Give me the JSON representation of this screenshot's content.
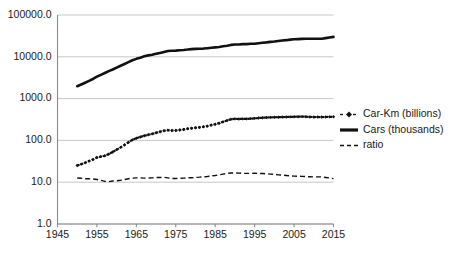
{
  "chart_data": {
    "type": "line",
    "title": "",
    "subtitle": "",
    "xlabel": "",
    "ylabel": "",
    "yscale": "log",
    "ylim": [
      1.0,
      100000.0
    ],
    "xlim": [
      1945,
      2015
    ],
    "grid": true,
    "legend_position": "right",
    "y_ticks": [
      "100000.0",
      "10000.0",
      "1000.0",
      "100.0",
      "10.0",
      "1.0"
    ],
    "y_tick_values": [
      100000.0,
      10000.0,
      1000.0,
      100.0,
      10.0,
      1.0
    ],
    "x_ticks": [
      "1945",
      "1955",
      "1965",
      "1975",
      "1985",
      "1995",
      "2005",
      "2015"
    ],
    "x_tick_values": [
      1945,
      1955,
      1965,
      1975,
      1985,
      1995,
      2005,
      2015
    ],
    "x": [
      1950,
      1951,
      1952,
      1953,
      1954,
      1955,
      1956,
      1957,
      1958,
      1959,
      1960,
      1961,
      1962,
      1963,
      1964,
      1965,
      1966,
      1967,
      1968,
      1969,
      1970,
      1971,
      1972,
      1973,
      1974,
      1975,
      1976,
      1977,
      1978,
      1979,
      1980,
      1981,
      1982,
      1983,
      1984,
      1985,
      1986,
      1987,
      1988,
      1989,
      1990,
      1991,
      1992,
      1993,
      1994,
      1995,
      1996,
      1997,
      1998,
      1999,
      2000,
      2001,
      2002,
      2003,
      2004,
      2005,
      2006,
      2007,
      2008,
      2009,
      2010,
      2011,
      2012,
      2013,
      2014,
      2015
    ],
    "series": [
      {
        "name": "Car-Km (billions)",
        "style": "dashed-with-diamond-markers",
        "marker": "diamond",
        "color": "#111111",
        "values": [
          25,
          27,
          29,
          32,
          35,
          39,
          41,
          43,
          47,
          53,
          60,
          68,
          78,
          90,
          103,
          113,
          121,
          129,
          136,
          143,
          152,
          161,
          170,
          176,
          172,
          173,
          178,
          183,
          190,
          196,
          200,
          205,
          212,
          220,
          232,
          244,
          258,
          278,
          300,
          320,
          328,
          325,
          327,
          328,
          332,
          337,
          343,
          348,
          352,
          356,
          358,
          359,
          362,
          363,
          366,
          368,
          369,
          371,
          368,
          364,
          362,
          363,
          362,
          363,
          366,
          367
        ]
      },
      {
        "name": "Cars (thousands)",
        "style": "solid",
        "marker": "none",
        "color": "#111111",
        "values": [
          1979,
          2180,
          2400,
          2650,
          2950,
          3350,
          3700,
          4100,
          4550,
          4970,
          5530,
          6120,
          6750,
          7450,
          8250,
          8920,
          9520,
          10300,
          10820,
          11230,
          11780,
          12360,
          13000,
          13820,
          14010,
          14060,
          14390,
          14600,
          14890,
          15290,
          15440,
          15580,
          15730,
          16090,
          16450,
          16790,
          17170,
          17850,
          18440,
          19250,
          19740,
          19740,
          20120,
          20100,
          20480,
          20500,
          21170,
          21680,
          22110,
          22780,
          23200,
          23900,
          24540,
          24990,
          25750,
          26210,
          26510,
          26880,
          27000,
          27000,
          27000,
          27000,
          27000,
          28000,
          29000,
          30000
        ]
      },
      {
        "name": "ratio",
        "style": "dashed",
        "marker": "none",
        "color": "#111111",
        "values": [
          12.6,
          12.4,
          12.1,
          12.1,
          11.9,
          11.6,
          11.1,
          10.5,
          10.3,
          10.7,
          10.8,
          11.1,
          11.6,
          12.1,
          12.5,
          12.7,
          12.7,
          12.5,
          12.6,
          12.7,
          12.9,
          13.0,
          13.1,
          12.7,
          12.3,
          12.3,
          12.4,
          12.5,
          12.8,
          12.8,
          13.0,
          13.2,
          13.5,
          13.7,
          14.1,
          14.5,
          15.0,
          15.6,
          16.3,
          16.6,
          16.6,
          16.5,
          16.3,
          16.3,
          16.2,
          16.4,
          16.2,
          16.1,
          15.9,
          15.6,
          15.4,
          15.0,
          14.8,
          14.5,
          14.2,
          14.0,
          13.9,
          13.8,
          13.6,
          13.5,
          13.4,
          13.4,
          13.4,
          13.0,
          12.6,
          12.2
        ]
      }
    ],
    "legend": [
      {
        "label": "Car-Km (billions)",
        "marker": "dashed-diamond"
      },
      {
        "label": "Cars (thousands)",
        "marker": "solid"
      },
      {
        "label": "ratio",
        "marker": "dashed"
      }
    ]
  }
}
